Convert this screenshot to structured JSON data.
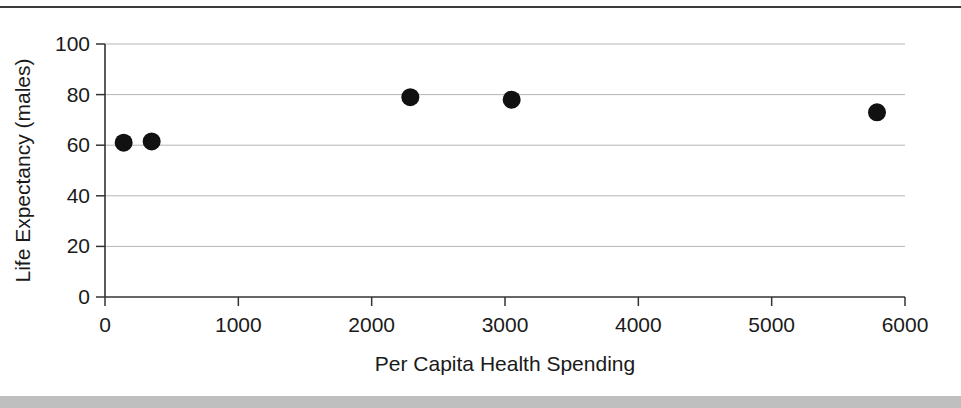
{
  "figure": {
    "top_rule_color": "#3a3a3a",
    "bottom_band_color": "#bfbfbf",
    "background_color": "#ffffff"
  },
  "chart_data": {
    "type": "scatter",
    "title": "",
    "xlabel": "Per Capita Health Spending",
    "ylabel": "Life Expectancy (males)",
    "xlim": [
      0,
      6000
    ],
    "ylim": [
      0,
      100
    ],
    "xticks": [
      0,
      1000,
      2000,
      3000,
      4000,
      5000,
      6000
    ],
    "yticks": [
      0,
      20,
      40,
      60,
      80,
      100
    ],
    "xtick_labels": [
      "0",
      "1000",
      "2000",
      "3000",
      "4000",
      "5000",
      "6000"
    ],
    "ytick_labels": [
      "0",
      "20",
      "40",
      "60",
      "80",
      "100"
    ],
    "grid": "horizontal",
    "legend": "none",
    "marker_color": "#111111",
    "marker_size_px": 18,
    "points": [
      {
        "x": 140,
        "y": 61
      },
      {
        "x": 350,
        "y": 61.5
      },
      {
        "x": 2290,
        "y": 79
      },
      {
        "x": 3050,
        "y": 78
      },
      {
        "x": 5790,
        "y": 73
      }
    ],
    "series": [
      {
        "name": "Countries",
        "x": [
          140,
          350,
          2290,
          3050,
          5790
        ],
        "values": [
          61,
          61.5,
          79,
          78,
          73
        ]
      }
    ]
  }
}
